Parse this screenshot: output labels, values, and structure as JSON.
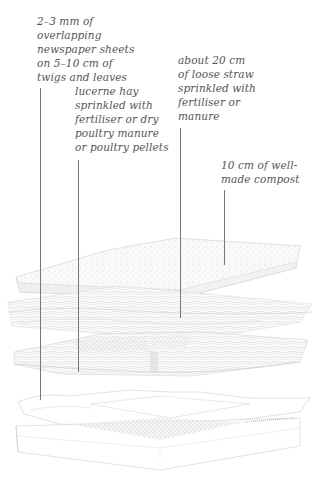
{
  "diagram": {
    "type": "exploded layer diagram",
    "colors": {
      "background": "#ffffff",
      "text": "#555555",
      "leader": "#777777",
      "sketch": "#bdbdbd"
    }
  },
  "labels": [
    {
      "id": "newspaper",
      "text": "2–3 mm of\noverlapping\nnewspaper sheets\non 5–10 cm of\ntwigs and leaves"
    },
    {
      "id": "lucerne",
      "text": "lucerne hay\nsprinkled with\nfertiliser or dry\npoultry manure\nor poultry pellets"
    },
    {
      "id": "straw",
      "text": "about 20 cm\nof loose straw\nsprinkled with\nfertiliser or\nmanure"
    },
    {
      "id": "compost",
      "text": "10 cm of well-\nmade compost"
    }
  ],
  "layers_top_to_bottom": [
    "10 cm of well-made compost",
    "about 20 cm of loose straw sprinkled with fertiliser or manure",
    "lucerne hay sprinkled with fertiliser or dry poultry manure or poultry pellets",
    "2–3 mm of overlapping newspaper sheets on 5–10 cm of twigs and leaves",
    "timber-framed raised bed base"
  ]
}
